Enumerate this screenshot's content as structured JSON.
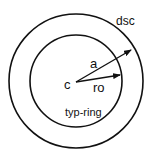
{
  "diagram": {
    "labels": {
      "outer": "dsc",
      "inner": "typ-ring",
      "center": "c",
      "radius_outer": "a",
      "radius_inner": "ro"
    },
    "colors": {
      "stroke": "#111111",
      "background": "#ffffff"
    }
  }
}
